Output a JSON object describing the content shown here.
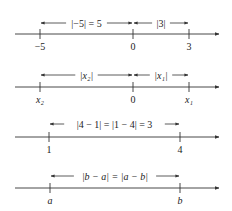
{
  "diagrams": [
    {
      "axis_y": 34,
      "arrow_y": 23,
      "ticks": [
        {
          "x": 40,
          "label": "−5",
          "italic": false
        },
        {
          "x": 133,
          "label": "0",
          "italic": false
        },
        {
          "x": 189,
          "label": "3",
          "italic": false
        }
      ],
      "spans": [
        {
          "from": 40,
          "to": 133,
          "label": "|−5| = 5",
          "italic": false
        },
        {
          "from": 133,
          "to": 189,
          "label": "|3|",
          "italic": false
        }
      ]
    },
    {
      "axis_y": 87,
      "arrow_y": 75,
      "ticks": [
        {
          "x": 40,
          "label": "x₂",
          "italic": true
        },
        {
          "x": 133,
          "label": "0",
          "italic": false
        },
        {
          "x": 189,
          "label": "x₁",
          "italic": true
        }
      ],
      "spans": [
        {
          "from": 40,
          "to": 133,
          "label": "|x₂|",
          "italic": true
        },
        {
          "from": 133,
          "to": 189,
          "label": "|x₁|",
          "italic": true
        }
      ]
    },
    {
      "axis_y": 137,
      "arrow_y": 124,
      "ticks": [
        {
          "x": 49,
          "label": "1",
          "italic": false
        },
        {
          "x": 180,
          "label": "4",
          "italic": false
        }
      ],
      "spans": [
        {
          "from": 49,
          "to": 180,
          "label": "|4 − 1| = |1 − 4| = 3",
          "italic": false
        }
      ]
    },
    {
      "axis_y": 188,
      "arrow_y": 176,
      "ticks": [
        {
          "x": 50,
          "label": "a",
          "italic": true
        },
        {
          "x": 180,
          "label": "b",
          "italic": true
        }
      ],
      "spans": [
        {
          "from": 50,
          "to": 180,
          "label": "|b − a| = |a − b|",
          "italic": true
        }
      ]
    }
  ],
  "axis_start_x": 15,
  "axis_end_x": 219,
  "colors": {
    "line": "#333333",
    "text": "#222222"
  }
}
